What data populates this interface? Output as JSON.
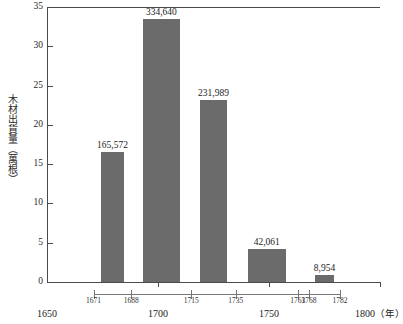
{
  "chart_data": {
    "type": "bar",
    "title": "",
    "xlabel": "年",
    "ylabel": "木材出貨量（萬根）",
    "ylim": [
      0,
      35
    ],
    "xlim": [
      1650,
      1800
    ],
    "grid": false,
    "legend": "none",
    "y_ticks": [
      "0",
      "5",
      "10",
      "15",
      "20",
      "25",
      "30",
      "35"
    ],
    "y_tick_values": [
      0,
      5,
      10,
      15,
      20,
      25,
      30,
      35
    ],
    "x_decade_ticks": [
      "1650",
      "1700",
      "1750",
      "1800"
    ],
    "x_decade_values": [
      1650,
      1700,
      1750,
      1800
    ],
    "x_unit_label": "（年）",
    "period_ticks": [
      "1671",
      "1688",
      "1715",
      "1735",
      "1763",
      "1768",
      "1782"
    ],
    "period_tick_values": [
      1671,
      1688,
      1715,
      1735,
      1763,
      1768,
      1782
    ],
    "bar_color": "#6b6b6b",
    "axis_color": "#4a4a4a",
    "categories": [
      "1671-1688",
      "1688-1715",
      "1715-1735",
      "1735-1763",
      "1768-1782"
    ],
    "values": [
      16.5572,
      33.464,
      23.1989,
      4.2061,
      0.8954
    ],
    "value_labels": [
      "165,572",
      "334,640",
      "231,989",
      "42,061",
      "8,954"
    ],
    "value_unit": "根",
    "bars": [
      {
        "label": "165,572",
        "value": 16.5572,
        "start_year": 1671,
        "end_year": 1688
      },
      {
        "label": "334,640",
        "value": 33.464,
        "start_year": 1688,
        "end_year": 1715
      },
      {
        "label": "231,989",
        "value": 23.1989,
        "start_year": 1715,
        "end_year": 1735
      },
      {
        "label": "42,061",
        "value": 4.2061,
        "start_year": 1735,
        "end_year": 1763
      },
      {
        "label": "8,954",
        "value": 0.8954,
        "start_year": 1768,
        "end_year": 1782
      }
    ]
  }
}
